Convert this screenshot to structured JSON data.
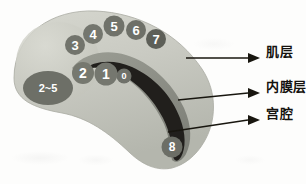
{
  "diagram": {
    "background_color": "#fdfdfc",
    "layers": [
      {
        "id": "myometrium",
        "label": "肌层",
        "color": "#c9cac2"
      },
      {
        "id": "endometrium",
        "label": "内膜层",
        "color": "#8e9088"
      },
      {
        "id": "cavity",
        "label": "宫腔",
        "color": "#211f1c"
      }
    ],
    "callouts": [
      {
        "name": "myometrium",
        "label": "肌层",
        "x": 266,
        "y": 52
      },
      {
        "name": "endometrium",
        "label": "内膜层",
        "x": 266,
        "y": 87
      },
      {
        "name": "cavity",
        "label": "宫腔",
        "x": 266,
        "y": 115
      }
    ],
    "markers": [
      {
        "id": "m0",
        "label": "0",
        "cx": 124,
        "cy": 76,
        "r": 7.5,
        "fill": "#6f716a",
        "font_size": 9
      },
      {
        "id": "m1",
        "label": "1",
        "cx": 106,
        "cy": 74,
        "r": 11.5,
        "fill": "#75776f",
        "font_size": 14
      },
      {
        "id": "m2",
        "label": "2",
        "cx": 83,
        "cy": 73,
        "r": 11,
        "fill": "#76786f",
        "font_size": 14
      },
      {
        "id": "m3",
        "label": "3",
        "cx": 75,
        "cy": 45,
        "r": 10,
        "fill": "#72746c",
        "font_size": 13
      },
      {
        "id": "m4",
        "label": "4",
        "cx": 93,
        "cy": 34,
        "r": 10,
        "fill": "#74766e",
        "font_size": 13
      },
      {
        "id": "m5",
        "label": "5",
        "cx": 114,
        "cy": 26,
        "r": 10.5,
        "fill": "#70726a",
        "font_size": 13
      },
      {
        "id": "m6",
        "label": "6",
        "cx": 136,
        "cy": 30,
        "r": 10,
        "fill": "#6e7068",
        "font_size": 13
      },
      {
        "id": "m7",
        "label": "7",
        "cx": 156,
        "cy": 39,
        "r": 10,
        "fill": "#5d5f58",
        "font_size": 13
      },
      {
        "id": "m8",
        "label": "8",
        "cx": 172,
        "cy": 147,
        "r": 10.5,
        "fill": "#6c6e66",
        "font_size": 12
      },
      {
        "id": "m2to5",
        "label": "2~5",
        "cx": 48,
        "cy": 88,
        "rx": 25,
        "ry": 17,
        "fill": "#6d6f67",
        "font_size": 11
      }
    ]
  }
}
